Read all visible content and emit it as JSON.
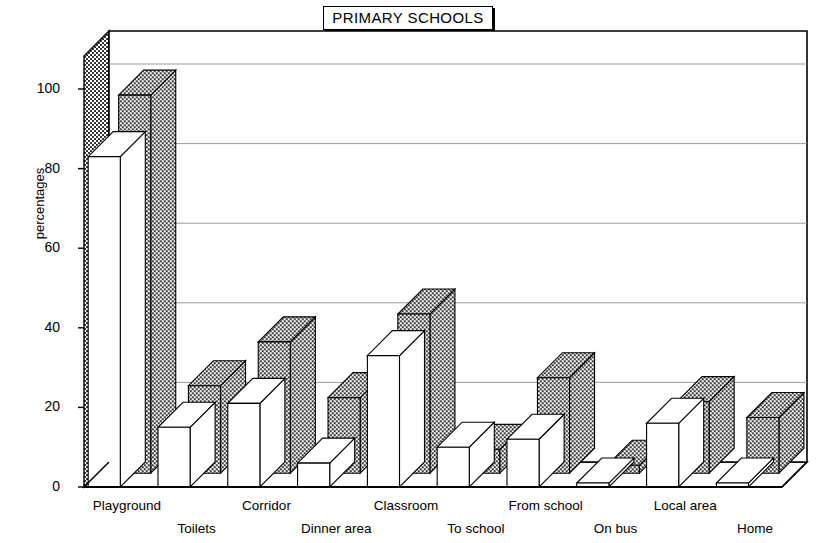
{
  "chart_data": {
    "type": "bar",
    "title": "PRIMARY SCHOOLS",
    "xlabel": "",
    "ylabel": "percentages",
    "ylim": [
      0,
      100
    ],
    "yticks": [
      0,
      20,
      40,
      60,
      80,
      100
    ],
    "grid": true,
    "legend": "none",
    "style": "3d-clustered-bar",
    "categories": [
      "Playground",
      "Toilets",
      "Corridor",
      "Dinner area",
      "Classroom",
      "To school",
      "From school",
      "On bus",
      "Local area",
      "Home"
    ],
    "series": [
      {
        "name": "front-white",
        "fill": "white",
        "values": [
          83,
          15,
          21,
          6,
          33,
          10,
          12,
          1,
          16,
          1
        ]
      },
      {
        "name": "back-dotted",
        "fill": "dotted",
        "values": [
          95,
          22,
          33,
          19,
          40,
          6,
          24,
          2,
          18,
          14
        ]
      }
    ]
  },
  "colors": {
    "ink": "#000000",
    "paper": "#ffffff",
    "grid": "#9a9a9a",
    "dotted_fill": "#d9d9d9"
  }
}
